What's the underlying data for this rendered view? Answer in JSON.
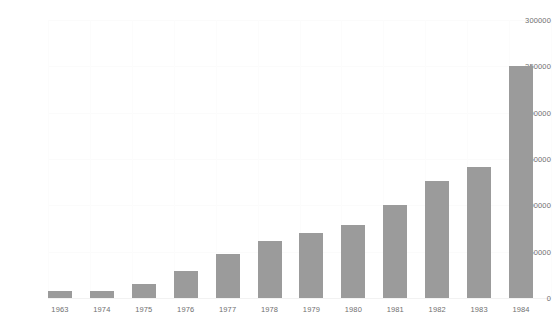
{
  "chart_data": {
    "type": "bar",
    "title": "",
    "subtitle": "",
    "xlabel": "",
    "ylabel": "",
    "categories": [
      "1963",
      "1974",
      "1975",
      "1976",
      "1977",
      "1978",
      "1979",
      "1980",
      "1981",
      "1982",
      "1983",
      "1984"
    ],
    "values": [
      7500,
      8000,
      15000,
      29000,
      47500,
      61000,
      70000,
      79000,
      100000,
      126000,
      141000,
      250000
    ],
    "series": [
      {
        "name": "",
        "values": [
          7500,
          8000,
          15000,
          29000,
          47500,
          61000,
          70000,
          79000,
          100000,
          126000,
          141000,
          250000
        ]
      }
    ],
    "ylim": [
      0,
      300000
    ],
    "y_ticks": [
      0,
      50000,
      100000,
      150000,
      200000,
      250000,
      300000
    ],
    "y_tick_labels": [
      "0",
      "50000",
      "100000",
      "150000",
      "200000",
      "250000",
      "300000"
    ],
    "grid": true,
    "legend": "none",
    "bar_color": "#9b9b9b",
    "axis_text_color": "#6f6f6f",
    "background_color": "#ffffff"
  }
}
